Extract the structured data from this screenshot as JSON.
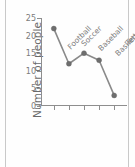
{
  "chart_data": {
    "type": "line",
    "title": "",
    "xlabel": "",
    "ylabel": "Number of people",
    "categories": [
      "Football",
      "Soccer",
      "Baseball",
      "Basketball",
      "Tennis"
    ],
    "values": [
      22,
      12,
      15,
      13,
      3
    ],
    "series": [
      {
        "name": "Number of people",
        "values": [
          22,
          12,
          15,
          13,
          3
        ]
      }
    ],
    "ylim": [
      0,
      25
    ],
    "yticks": [
      0,
      5,
      10,
      15,
      20,
      25
    ],
    "ytick_labels": [
      "0",
      "5",
      "10",
      "15",
      "20",
      "25"
    ],
    "grid": false,
    "legend": false,
    "legend_position": "none",
    "marker": "circle",
    "line_color": "#8a8a8a",
    "marker_color": "#6e6e6e",
    "axis_color": "#8e8e8e",
    "background_color": "#fefefe",
    "xtick_label_rotation": "-45"
  }
}
